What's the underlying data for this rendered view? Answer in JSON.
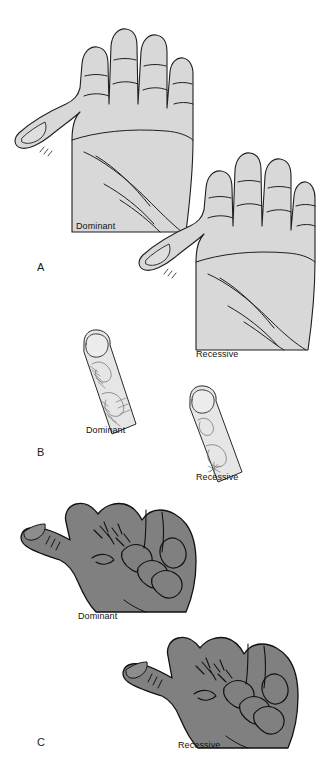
{
  "figure": {
    "width": 317,
    "height": 776,
    "background_color": "#ffffff",
    "light_hand_fill": "#d9d9d9",
    "dark_hand_fill": "#808080",
    "outline_color": "#1a1a1a",
    "text_color": "#111111"
  },
  "panels": [
    {
      "letter": "A",
      "trait": "palm-hand-outline",
      "items": [
        {
          "label": "Dominant",
          "position": "upper-left",
          "shading": "light"
        },
        {
          "label": "Recessive",
          "position": "middle-right",
          "shading": "light"
        }
      ]
    },
    {
      "letter": "B",
      "trait": "fingerprint-pattern",
      "items": [
        {
          "label": "Dominant",
          "position": "left",
          "shading": "light"
        },
        {
          "label": "Recessive",
          "position": "right",
          "shading": "light"
        }
      ]
    },
    {
      "letter": "C",
      "trait": "hand-clasping",
      "items": [
        {
          "label": "Dominant",
          "position": "left",
          "shading": "dark"
        },
        {
          "label": "Recessive",
          "position": "right",
          "shading": "dark"
        }
      ]
    }
  ],
  "labels": {
    "panel_a_letter": "A",
    "panel_b_letter": "B",
    "panel_c_letter": "C",
    "a_dominant": "Dominant",
    "a_recessive": "Recessive",
    "b_dominant": "Dominant",
    "b_recessive": "Recessive",
    "c_dominant": "Dominant",
    "c_recessive": "Recessive"
  }
}
